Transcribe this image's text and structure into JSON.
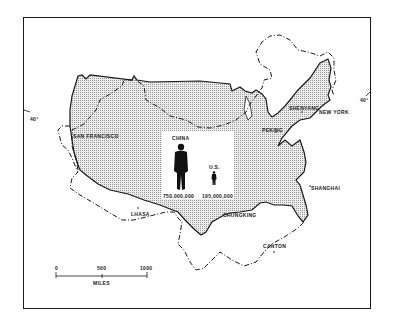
{
  "map": {
    "title": "",
    "description": "Outline of the United States superimposed on China at the same scale",
    "latitude_labels": {
      "left": "40°",
      "right": "40°"
    },
    "cities": [
      {
        "name": "SAN FRANCISCO",
        "x": 73,
        "y": 133
      },
      {
        "name": "SHENYANG",
        "x": 289,
        "y": 107
      },
      {
        "name": "NEW YORK",
        "x": 320,
        "y": 109
      },
      {
        "name": "PEKING",
        "x": 262,
        "y": 128
      },
      {
        "name": "SHANGHAI",
        "x": 311,
        "y": 185
      },
      {
        "name": "LHASA",
        "x": 133,
        "y": 211
      },
      {
        "name": "CHUNGKING",
        "x": 224,
        "y": 212
      },
      {
        "name": "CANTON",
        "x": 263,
        "y": 244
      }
    ],
    "inset": {
      "china_label": "CHINA",
      "china_population": "750,000,000",
      "us_label": "U.S.",
      "us_population": "195,000,000"
    },
    "scale_bar": {
      "ticks": [
        "0",
        "500",
        "1000"
      ],
      "unit": "MILES"
    },
    "legend": {
      "us_outline": "solid line, stippled fill",
      "china_outline": "dash-dot line"
    },
    "colors": {
      "ink": "#1a1a1a",
      "stipple": "#d8d8d8",
      "background": "#ffffff"
    }
  }
}
